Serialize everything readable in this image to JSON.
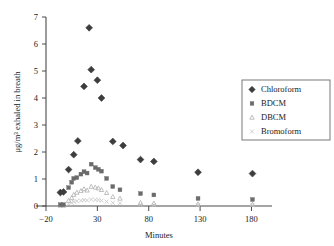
{
  "chart_data": {
    "type": "scatter",
    "title": "",
    "xlabel": "Minutes",
    "ylabel": "μg/m³ exhaled in breath",
    "xlim": [
      -20,
      200
    ],
    "ylim": [
      0,
      7
    ],
    "xticks": [
      -20,
      30,
      80,
      130,
      180
    ],
    "yticks": [
      0,
      1,
      2,
      3,
      4,
      5,
      6,
      7
    ],
    "grid": false,
    "legend_position": "right",
    "series": [
      {
        "name": "Chloroform",
        "marker": "diamond",
        "color": "#3d3d3d",
        "points": [
          [
            -6,
            0.5
          ],
          [
            -3,
            0.52
          ],
          [
            2,
            1.35
          ],
          [
            7,
            1.9
          ],
          [
            11,
            2.41
          ],
          [
            17,
            4.43
          ],
          [
            22,
            6.6
          ],
          [
            24,
            5.05
          ],
          [
            30,
            4.66
          ],
          [
            34,
            4.0
          ],
          [
            45,
            2.39
          ],
          [
            55,
            2.24
          ],
          [
            72,
            1.72
          ],
          [
            85,
            1.65
          ],
          [
            128,
            1.25
          ],
          [
            181,
            1.2
          ]
        ]
      },
      {
        "name": "BDCM",
        "marker": "square",
        "color": "#6b6b6b",
        "points": [
          [
            -6,
            0.05
          ],
          [
            -3,
            0.05
          ],
          [
            2,
            0.68
          ],
          [
            5,
            0.88
          ],
          [
            7,
            1.02
          ],
          [
            10,
            1.05
          ],
          [
            14,
            1.18
          ],
          [
            17,
            1.27
          ],
          [
            20,
            1.22
          ],
          [
            24,
            1.55
          ],
          [
            28,
            1.42
          ],
          [
            31,
            1.36
          ],
          [
            34,
            1.29
          ],
          [
            39,
            1.02
          ],
          [
            45,
            0.72
          ],
          [
            52,
            0.6
          ],
          [
            72,
            0.46
          ],
          [
            85,
            0.41
          ],
          [
            128,
            0.28
          ],
          [
            181,
            0.24
          ]
        ]
      },
      {
        "name": "DBCM",
        "marker": "triangle",
        "color": "#b8b8b8",
        "points": [
          [
            -6,
            0.02
          ],
          [
            -3,
            0.02
          ],
          [
            2,
            0.2
          ],
          [
            5,
            0.3
          ],
          [
            7,
            0.42
          ],
          [
            10,
            0.5
          ],
          [
            14,
            0.56
          ],
          [
            17,
            0.63
          ],
          [
            20,
            0.58
          ],
          [
            24,
            0.72
          ],
          [
            28,
            0.69
          ],
          [
            31,
            0.66
          ],
          [
            34,
            0.6
          ],
          [
            39,
            0.49
          ],
          [
            45,
            0.34
          ],
          [
            52,
            0.28
          ],
          [
            72,
            0.12
          ],
          [
            85,
            0.1
          ],
          [
            128,
            0.07
          ],
          [
            181,
            0.06
          ]
        ]
      },
      {
        "name": "Bromoform",
        "marker": "cross",
        "color": "#c9c9c9",
        "points": [
          [
            -6,
            0.01
          ],
          [
            -3,
            0.01
          ],
          [
            2,
            0.08
          ],
          [
            5,
            0.12
          ],
          [
            7,
            0.16
          ],
          [
            10,
            0.18
          ],
          [
            14,
            0.2
          ],
          [
            17,
            0.22
          ],
          [
            20,
            0.21
          ],
          [
            24,
            0.24
          ],
          [
            28,
            0.23
          ],
          [
            31,
            0.22
          ],
          [
            34,
            0.2
          ],
          [
            39,
            0.16
          ],
          [
            45,
            0.12
          ],
          [
            52,
            0.1
          ],
          [
            72,
            0.05
          ],
          [
            85,
            0.04
          ],
          [
            128,
            0.03
          ],
          [
            181,
            0.03
          ]
        ]
      }
    ]
  },
  "legend": {
    "items": [
      {
        "label": "Chloroform"
      },
      {
        "label": "BDCM"
      },
      {
        "label": "DBCM"
      },
      {
        "label": "Bromoform"
      }
    ]
  },
  "axes": {
    "x_title": "Minutes",
    "y_title": "μg/m³ exhaled in breath",
    "x_tick_labels": [
      "−20",
      "30",
      "80",
      "130",
      "180"
    ],
    "y_tick_labels": [
      "0",
      "1",
      "2",
      "3",
      "4",
      "5",
      "6",
      "7"
    ]
  }
}
